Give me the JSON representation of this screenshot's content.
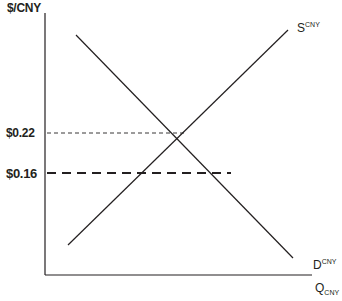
{
  "diagram": {
    "type": "supply-demand",
    "y_axis_label": "$/CNY",
    "x_axis_label": {
      "main": "Q",
      "sub": "CNY"
    },
    "supply_label": {
      "main": "S",
      "sup": "CNY"
    },
    "demand_label": {
      "main": "D",
      "sup": "CNY"
    },
    "price_levels": [
      {
        "label": "$0.22",
        "style": "thin-dashed",
        "role": "equilibrium"
      },
      {
        "label": "$0.16",
        "style": "thick-dashed",
        "role": "price-ceiling"
      }
    ],
    "colors": {
      "line": "#231f20",
      "background": "#ffffff"
    }
  }
}
